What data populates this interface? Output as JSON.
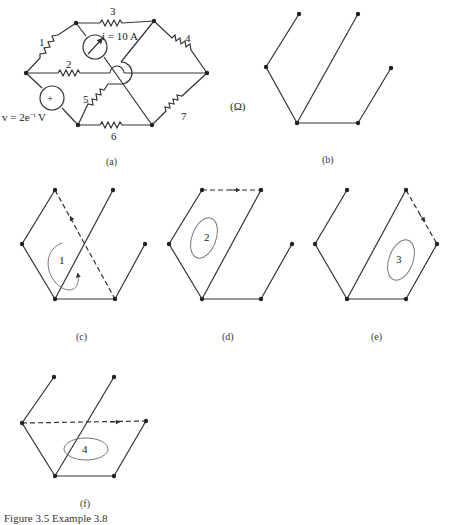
{
  "figure": {
    "caption": "Figure 3.5  Example 3.8",
    "unit_label": "(Ω)",
    "panels": [
      {
        "id": "a",
        "label": "(a)",
        "description": "Circuit with 7 resistors, current source and voltage source"
      },
      {
        "id": "b",
        "label": "(b)",
        "description": "Tree of the graph"
      },
      {
        "id": "c",
        "label": "(c)",
        "loop_number": "1"
      },
      {
        "id": "d",
        "label": "(d)",
        "loop_number": "2"
      },
      {
        "id": "e",
        "label": "(e)",
        "loop_number": "3"
      },
      {
        "id": "f",
        "label": "(f)",
        "loop_number": "4"
      }
    ],
    "circuit": {
      "resistors": [
        "1",
        "2",
        "3",
        "4",
        "5",
        "6",
        "7"
      ],
      "current_source": "i = 10 A",
      "voltage_source": "v = 2e",
      "voltage_exponent": "−t",
      "voltage_unit": " V",
      "plus_sign": "+"
    }
  }
}
